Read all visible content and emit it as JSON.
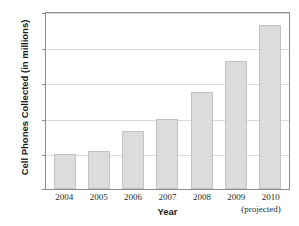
{
  "chart_data": {
    "type": "bar",
    "title": "",
    "title_cropped_note": "",
    "categories": [
      "2004",
      "2005",
      "2006",
      "2007",
      "2008",
      "2009",
      "2010"
    ],
    "values": [
      2.0,
      2.15,
      3.3,
      4.0,
      5.5,
      7.3,
      9.3
    ],
    "series": [
      {
        "name": "Cell Phones Collected",
        "values": [
          2.0,
          2.15,
          3.3,
          4.0,
          5.5,
          7.3,
          9.3
        ]
      }
    ],
    "xlabel": "Year",
    "ylabel": "Cell Phones Collected (in millions)",
    "ylim": [
      0,
      10
    ],
    "yticks": [
      "0",
      "2",
      "4",
      "6",
      "8",
      "10"
    ],
    "ytick_values": [
      0,
      2,
      4,
      6,
      8,
      10
    ],
    "grid": true,
    "grid_axis": "y",
    "legend": "none",
    "annotations": [
      {
        "text": "(projected)",
        "for_category": "2010"
      }
    ],
    "colors": {
      "bar_fill": "#dcdcdc",
      "bar_stroke": "#c2c2c2",
      "gridline": "#d9d9d9",
      "frame": "#8d8d8d",
      "plot_background": "#ffffff",
      "text": "#1a1a1a"
    }
  }
}
